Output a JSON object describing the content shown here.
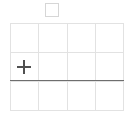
{
  "canvas": {
    "handle": {
      "icon": "square-outline-icon"
    },
    "grid": {
      "columns": 4,
      "rows": 3,
      "cells": [
        {
          "id": "r1c1"
        },
        {
          "id": "r1c2"
        },
        {
          "id": "r1c3"
        },
        {
          "id": "r1c4"
        },
        {
          "id": "r2c1",
          "icon": "plus-icon"
        },
        {
          "id": "r2c2"
        },
        {
          "id": "r2c3"
        },
        {
          "id": "r2c4"
        },
        {
          "id": "r3c1"
        },
        {
          "id": "r3c2"
        },
        {
          "id": "r3c3"
        },
        {
          "id": "r3c4"
        }
      ],
      "line_color": "#e2e2e2"
    },
    "divider": {
      "color": "#6e6e6e",
      "after_row": 2
    },
    "add_button": {
      "icon": "plus-icon",
      "color": "#505050"
    }
  }
}
